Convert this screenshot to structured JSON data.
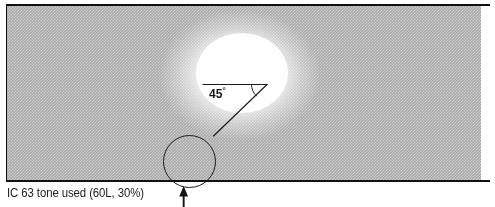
{
  "figure": {
    "name": "tone-and-starburst-figure",
    "caption": "IC 63 tone used (60L, 30%)",
    "panel": {
      "tone_label": "IC 63",
      "tone_lines_per_inch": "60L",
      "tone_percent": "30%",
      "fill_color": "#a9a9a9",
      "border_color": "#111111"
    },
    "annotations": {
      "angle_value": "45",
      "angle_unit": "°",
      "angle_label": "45°",
      "callout_circle": {
        "name": "detail-callout-circle",
        "center_x": 183,
        "center_y": 157,
        "radius": 26
      },
      "pointer_arrow": {
        "name": "pointer-arrow",
        "direction": "up"
      }
    },
    "starburst": {
      "name": "starburst-highlight",
      "center_x": 240,
      "center_y": 75,
      "core_color": "#ffffff"
    }
  }
}
